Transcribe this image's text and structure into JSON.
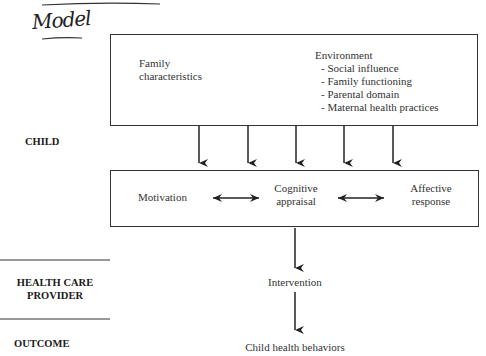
{
  "handwritten_note": "Model",
  "rows": [
    {
      "label": "CHILD"
    },
    {
      "label": "HEALTH CARE PROVIDER",
      "lines": [
        "HEALTH CARE",
        "PROVIDER"
      ]
    },
    {
      "label": "OUTCOME"
    }
  ],
  "top_box": {
    "family": [
      "Family",
      "characteristics"
    ],
    "environment": {
      "title": "Environment",
      "items": [
        "- Social influence",
        "- Family functioning",
        "- Parental domain",
        "- Maternal health practices"
      ]
    }
  },
  "middle_box": {
    "motivation": "Motivation",
    "cognitive": [
      "Cognitive",
      "appraisal"
    ],
    "affective": [
      "Affective",
      "response"
    ]
  },
  "intervention": "Intervention",
  "outcome": "Child health behaviors"
}
